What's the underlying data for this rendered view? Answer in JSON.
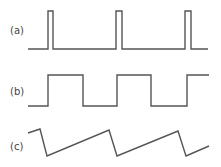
{
  "figure": {
    "stroke_color": "#555555",
    "label_color": "#444444",
    "panels": [
      {
        "id": "a",
        "label": "(a)",
        "description": "narrow periodic pulse train",
        "label_pos": [
          10,
          34
        ],
        "points": "28,49 48,49 48,11 53,11 53,49 116,49 116,11 122,11 122,49 185,49 185,11 191,11 191,49 208,49"
      },
      {
        "id": "b",
        "label": "(b)",
        "description": "square wave, ~50% duty cycle",
        "label_pos": [
          10,
          95
        ],
        "points": "28,106 48,106 48,75 83,75 83,106 117,106 117,75 151,75 151,106 187,106 187,75 209,75"
      },
      {
        "id": "c",
        "label": "(c)",
        "description": "sawtooth (ramp) wave",
        "label_pos": [
          10,
          150
        ],
        "points": "28,133 40,129 47,156 109,130 117,156 178,131 186,156 209,146"
      }
    ]
  }
}
